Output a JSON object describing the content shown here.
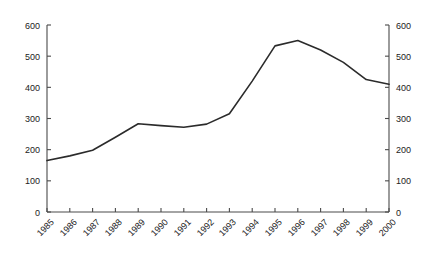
{
  "chart_data": {
    "type": "line",
    "title": "",
    "subtitle": "",
    "xlabel": "",
    "ylabel": "",
    "categories": [
      "1985",
      "1986",
      "1987",
      "1988",
      "1989",
      "1990",
      "1991",
      "1992",
      "1993",
      "1994",
      "1995",
      "1996",
      "1997",
      "1998",
      "1999",
      "2000"
    ],
    "values": [
      165,
      180,
      198,
      240,
      283,
      277,
      272,
      282,
      315,
      420,
      533,
      550,
      520,
      480,
      425,
      410
    ],
    "series": [
      {
        "name": "series-1",
        "values": [
          165,
          180,
          198,
          240,
          283,
          277,
          272,
          282,
          315,
          420,
          533,
          550,
          520,
          480,
          425,
          410
        ]
      }
    ],
    "ylim": [
      0,
      600
    ],
    "ytick_values": [
      0,
      100,
      200,
      300,
      400,
      500,
      600
    ],
    "ytick_labels_left": [
      "0",
      "100",
      "200",
      "300",
      "400",
      "500",
      "600"
    ],
    "ytick_labels_right": [
      "0",
      "100",
      "200",
      "300",
      "400",
      "500",
      "600"
    ],
    "grid": false,
    "legend": false,
    "legend_position": "none",
    "line_color": "#2b2b2b",
    "axis_color": "#4a4a4a",
    "background_color": "#ffffff",
    "xtick_rotation_degrees": -45,
    "dual_y_axis": true
  }
}
